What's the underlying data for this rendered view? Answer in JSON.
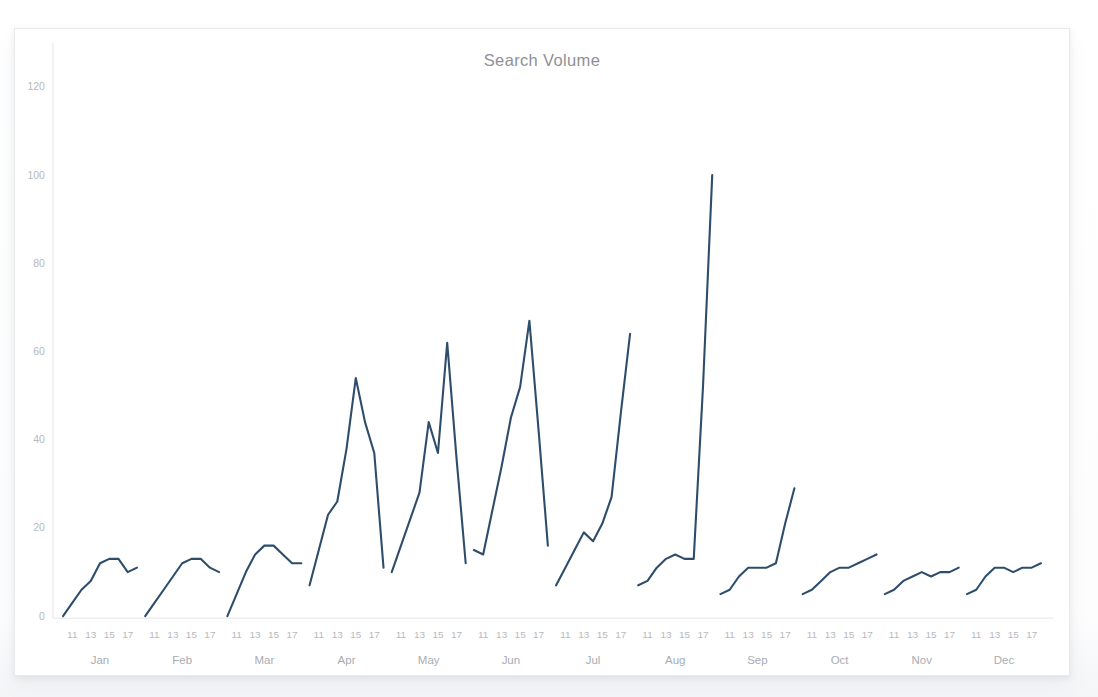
{
  "card": {
    "title": "Search Volume"
  },
  "chart_data": {
    "type": "line",
    "title": "Search Volume",
    "xlabel": "",
    "ylabel": "",
    "ylim": [
      0,
      125
    ],
    "yticks": [
      0,
      20,
      40,
      60,
      80,
      100,
      120
    ],
    "grid": false,
    "legend": false,
    "line_color": "#2e4d6b",
    "axis_color": "#e4e5e8",
    "tick_text_color": "#b6b9be",
    "month_text_color": "#a9acb2",
    "title_color": "#8e9196",
    "day_ticks": [
      11,
      13,
      15,
      17
    ],
    "months": [
      "Jan",
      "Feb",
      "Mar",
      "Apr",
      "May",
      "Jun",
      "Jul",
      "Aug",
      "Sep",
      "Oct",
      "Nov",
      "Dec"
    ],
    "series": [
      {
        "name": "Search Volume",
        "segments": [
          {
            "month": "Jan",
            "x": [
              10,
              11,
              12,
              13,
              14,
              15,
              16,
              17,
              18
            ],
            "values": [
              0,
              3,
              6,
              8,
              12,
              13,
              13,
              10,
              11
            ]
          },
          {
            "month": "Feb",
            "x": [
              10,
              11,
              12,
              13,
              14,
              15,
              16,
              17,
              18
            ],
            "values": [
              0,
              3,
              6,
              9,
              12,
              13,
              13,
              11,
              10
            ]
          },
          {
            "month": "Mar",
            "x": [
              10,
              11,
              12,
              13,
              14,
              15,
              16,
              17,
              18
            ],
            "values": [
              0,
              5,
              10,
              14,
              16,
              16,
              14,
              12,
              12
            ]
          },
          {
            "month": "Apr",
            "x": [
              10,
              11,
              12,
              13,
              14,
              15,
              16,
              17,
              18
            ],
            "values": [
              7,
              15,
              23,
              26,
              38,
              54,
              44,
              37,
              11
            ]
          },
          {
            "month": "May",
            "x": [
              10,
              11,
              12,
              13,
              14,
              15,
              16,
              17,
              18
            ],
            "values": [
              10,
              16,
              22,
              28,
              44,
              37,
              62,
              36,
              12
            ]
          },
          {
            "month": "Jun",
            "x": [
              10,
              11,
              12,
              13,
              14,
              15,
              16,
              17,
              18
            ],
            "values": [
              15,
              14,
              24,
              34,
              45,
              52,
              67,
              42,
              16
            ]
          },
          {
            "month": "Jul",
            "x": [
              10,
              11,
              12,
              13,
              14,
              15,
              16,
              17,
              18
            ],
            "values": [
              7,
              11,
              15,
              19,
              17,
              21,
              27,
              46,
              64
            ]
          },
          {
            "month": "Aug",
            "x": [
              10,
              11,
              12,
              13,
              14,
              15,
              16,
              17,
              18
            ],
            "values": [
              7,
              8,
              11,
              13,
              14,
              13,
              13,
              52,
              100
            ]
          },
          {
            "month": "Sep",
            "x": [
              10,
              11,
              12,
              13,
              14,
              15,
              16,
              17,
              18
            ],
            "values": [
              5,
              6,
              9,
              11,
              11,
              11,
              12,
              21,
              29
            ]
          },
          {
            "month": "Oct",
            "x": [
              10,
              11,
              12,
              13,
              14,
              15,
              16,
              17,
              18
            ],
            "values": [
              5,
              6,
              8,
              10,
              11,
              11,
              12,
              13,
              14
            ]
          },
          {
            "month": "Nov",
            "x": [
              10,
              11,
              12,
              13,
              14,
              15,
              16,
              17,
              18
            ],
            "values": [
              5,
              6,
              8,
              9,
              10,
              9,
              10,
              10,
              11
            ]
          },
          {
            "month": "Dec",
            "x": [
              10,
              11,
              12,
              13,
              14,
              15,
              16,
              17,
              18
            ],
            "values": [
              5,
              6,
              9,
              11,
              11,
              10,
              11,
              11,
              12
            ]
          }
        ]
      }
    ]
  }
}
